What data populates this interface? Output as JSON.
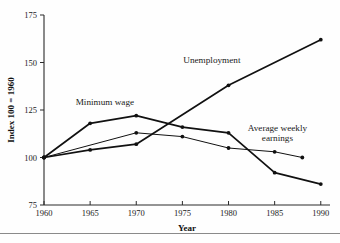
{
  "chart_data": {
    "type": "line",
    "title": "",
    "xlabel": "Year",
    "ylabel": "Index 100 = 1960",
    "xlim": [
      1960,
      1991
    ],
    "ylim": [
      75,
      175
    ],
    "grid": false,
    "legend_position": "inline-annotations",
    "x_ticks": [
      "1960",
      "1965",
      "1970",
      "1975",
      "1980",
      "1985",
      "1990"
    ],
    "y_ticks": [
      "75",
      "100",
      "125",
      "150",
      "175"
    ],
    "series": [
      {
        "name": "Unemployment",
        "x": [
          1960,
          1965,
          1970,
          1980,
          1990
        ],
        "values": [
          100,
          104,
          107,
          138,
          162
        ],
        "label_x": 1978.2,
        "label_y": 149.5,
        "color": "#111111"
      },
      {
        "name": "Minimum wage",
        "x": [
          1960,
          1965,
          1970,
          1975,
          1980,
          1985,
          1990
        ],
        "values": [
          100,
          118,
          122,
          116,
          113,
          92,
          86
        ],
        "label_x": 1966.6,
        "label_y": 127.5,
        "color": "#111111"
      },
      {
        "name": "Average weekly earnings",
        "x": [
          1960,
          1970,
          1975,
          1980,
          1985,
          1988
        ],
        "values": [
          100,
          113,
          111,
          105,
          103,
          100
        ],
        "label_line1": "Average weekly",
        "label_line2": "earnings",
        "label_x": 1985.3,
        "label_y": 114.0,
        "color": "#111111"
      }
    ]
  },
  "axes": {
    "y_axis_title": "Index 100 = 1960",
    "x_axis_title": "Year"
  },
  "annotations": {
    "unemployment_label": "Unemployment",
    "minimum_wage_label": "Minimum wage",
    "avg_earnings_label_line1": "Average weekly",
    "avg_earnings_label_line2": "earnings"
  }
}
